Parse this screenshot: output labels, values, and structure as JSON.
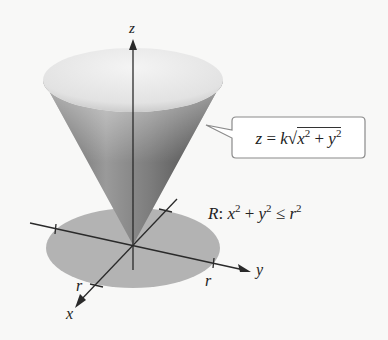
{
  "figure": {
    "axes": {
      "z_label": "z",
      "y_label": "y",
      "x_label": "x",
      "r_label_y": "r",
      "r_label_x": "r"
    },
    "callout": {
      "lhs": "z",
      "eq": " = ",
      "k": "k",
      "root": "√",
      "x": "x",
      "exp1": "2",
      "plus": " + ",
      "y": "y",
      "exp2": "2",
      "full": "z = k√(x² + y²)"
    },
    "region": {
      "R": "R",
      "colon": ": ",
      "x": "x",
      "exp1": "2",
      "plus": " + ",
      "y": "y",
      "exp2": "2",
      "le": " ≤ ",
      "r": "r",
      "exp3": "2",
      "full": "R: x² + y² ≤ r²"
    },
    "colors": {
      "disk": "#b3b3b3",
      "cone_dark": "#4a4a4a",
      "cone_light": "#e6e6e6",
      "axis": "#2a2a2a",
      "callout_border": "#888888"
    }
  }
}
